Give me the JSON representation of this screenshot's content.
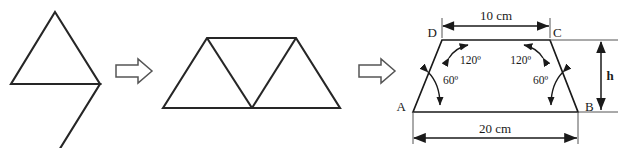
{
  "diagram": {
    "stroke_color": "#262626",
    "label_color": "#1a1a1a",
    "background": "#ffffff",
    "steps": [
      {
        "name": "rhombus",
        "caption": ""
      },
      {
        "name": "transform-arrow-1",
        "glyph": "hollow-right-arrow"
      },
      {
        "name": "trapezoid-of-three-triangles",
        "caption": ""
      },
      {
        "name": "transform-arrow-2",
        "glyph": "hollow-right-arrow"
      },
      {
        "name": "labelled-trapezoid",
        "caption": ""
      }
    ]
  },
  "shape1": {
    "name": "rhombus",
    "parts": 2,
    "has_horizontal_diagonal": true
  },
  "shape2": {
    "name": "trapezoid",
    "triangle_count": 3
  },
  "trapezoid": {
    "vertices": {
      "a": "A",
      "b": "B",
      "c": "C",
      "d": "D"
    },
    "dimensions": {
      "top": "10 cm",
      "bottom": "20 cm",
      "height": "h"
    },
    "angles": {
      "at_d": "120º",
      "at_c": "120º",
      "at_a": "60º",
      "at_b": "60º"
    }
  }
}
